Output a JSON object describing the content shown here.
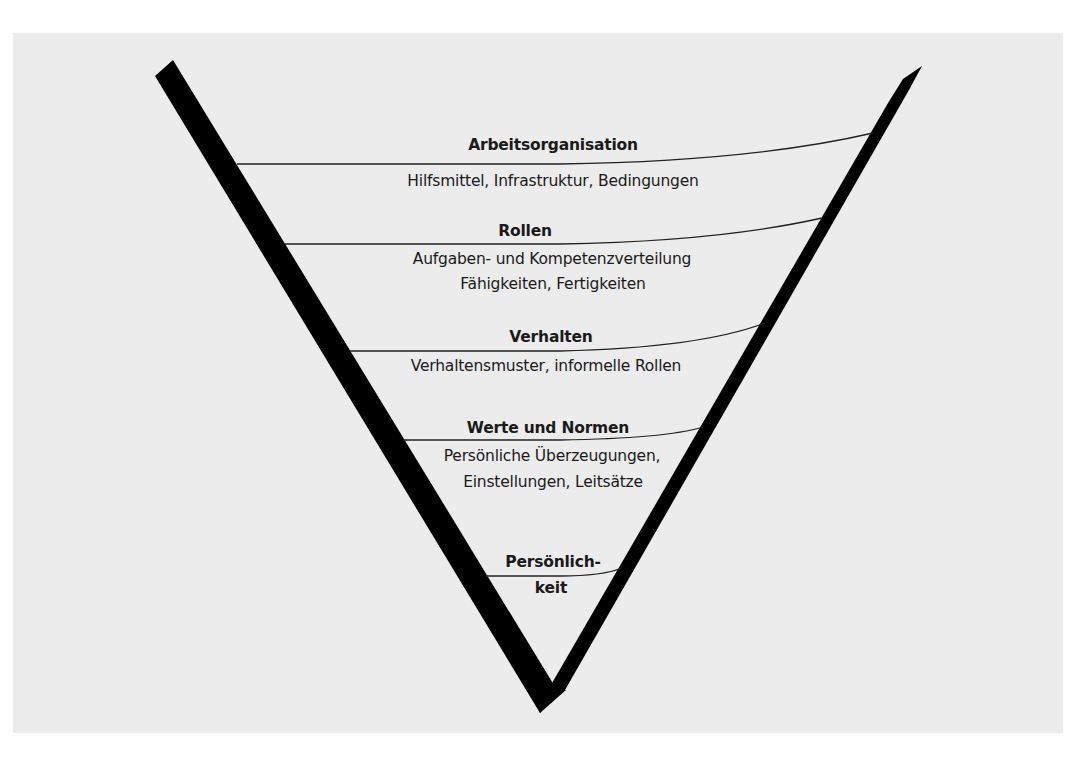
{
  "diagram": {
    "type": "funnel-levels",
    "background_color": "#ececec",
    "stroke_color": "#000000",
    "levels": [
      {
        "title": "Arbeitsorganisation",
        "description_lines": [
          "Hilfsmittel, Infrastruktur, Bedingungen"
        ]
      },
      {
        "title": "Rollen",
        "description_lines": [
          "Aufgaben- und Kompetenzverteilung",
          "Fähigkeiten, Fertigkeiten"
        ]
      },
      {
        "title": "Verhalten",
        "description_lines": [
          "Verhaltensmuster, informelle Rollen"
        ]
      },
      {
        "title": "Werte und Normen",
        "description_lines": [
          "Persönliche Überzeugungen,",
          "Einstellungen, Leitsätze"
        ]
      },
      {
        "title": "Persönlich-",
        "description_lines": [
          "keit"
        ]
      }
    ]
  }
}
